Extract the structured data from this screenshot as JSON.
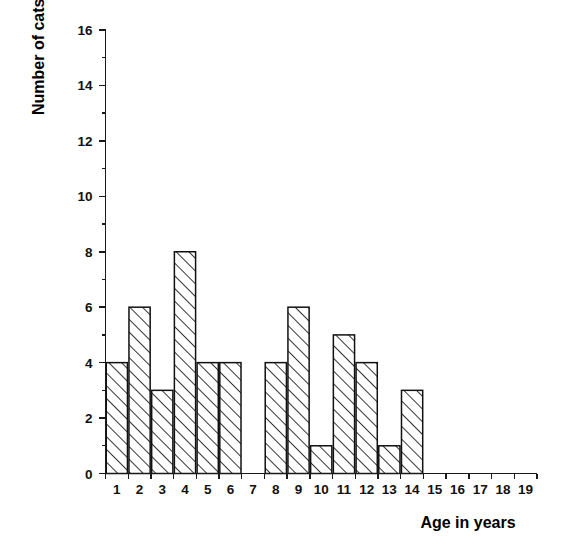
{
  "chart_data": {
    "type": "bar",
    "title": "",
    "subtitle": "",
    "xlabel": "Age in years",
    "ylabel": "Number of cats",
    "categories": [
      "1",
      "2",
      "3",
      "4",
      "5",
      "6",
      "7",
      "8",
      "9",
      "10",
      "11",
      "12",
      "13",
      "14",
      "15",
      "16",
      "17",
      "18",
      "19"
    ],
    "values": [
      4,
      6,
      3,
      8,
      4,
      4,
      0,
      4,
      6,
      1,
      5,
      4,
      1,
      3,
      0,
      0,
      0,
      0,
      0
    ],
    "xlim": [
      0.5,
      19.5
    ],
    "ylim": [
      0,
      16
    ],
    "y_major_ticks": [
      0,
      2,
      4,
      6,
      8,
      10,
      12,
      14,
      16
    ],
    "y_minor_ticks": [
      1,
      3,
      5,
      7,
      9,
      11,
      13,
      15
    ],
    "y_tick_labels": [
      "0",
      "2",
      "4",
      "6",
      "8",
      "10",
      "12",
      "14",
      "16"
    ],
    "x_tick_labels": [
      "1",
      "2",
      "3",
      "4",
      "5",
      "6",
      "7",
      "8",
      "9",
      "10",
      "11",
      "12",
      "13",
      "14",
      "15",
      "16",
      "17",
      "18",
      "19"
    ],
    "grid": false,
    "legend": "none",
    "bar_fill": "diagonal-hatch",
    "bar_fill_color": "#ffffff",
    "bar_edge_color": "#111111",
    "hatch_color": "#111111",
    "background_color": "#ffffff",
    "axis_color": "#1a1a1a",
    "tick_direction": "out"
  }
}
